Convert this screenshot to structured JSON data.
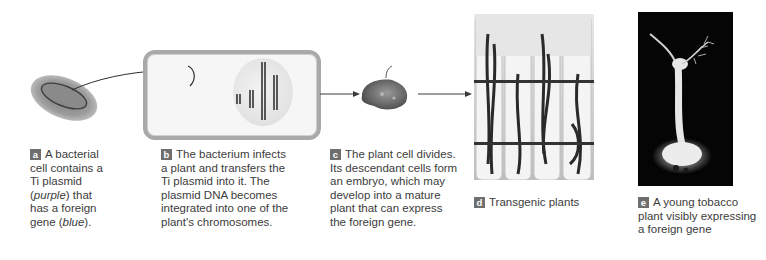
{
  "figure": {
    "steps": [
      {
        "id": "a",
        "badge": "a",
        "text_parts": [
          {
            "text": "A bacterial cell contains a Ti plasmid (",
            "italic": false
          },
          {
            "text": "purple",
            "italic": true
          },
          {
            "text": ") that has a foreign gene (",
            "italic": false
          },
          {
            "text": "blue",
            "italic": true
          },
          {
            "text": ").",
            "italic": false
          }
        ],
        "lines": [
          "A bacterial",
          "cell contains a",
          "Ti plasmid",
          "(purple) that",
          "has a foreign",
          "gene (blue)."
        ]
      },
      {
        "id": "b",
        "badge": "b",
        "lines": [
          "The bacterium infects",
          "a plant and transfers the",
          "Ti plasmid into it. The",
          "plasmid DNA becomes",
          "integrated into one of the",
          "plant's chromosomes."
        ]
      },
      {
        "id": "c",
        "badge": "c",
        "lines": [
          "The plant cell divides.",
          "Its descendant cells form",
          "an embryo, which may",
          "develop into a mature",
          "plant that can express",
          "the foreign gene."
        ]
      },
      {
        "id": "d",
        "badge": "d",
        "lines": [
          "Transgenic plants"
        ]
      },
      {
        "id": "e",
        "badge": "e",
        "lines": [
          "A young tobacco",
          "plant visibly expressing",
          "a foreign gene"
        ]
      }
    ],
    "italic_words": {
      "purple": "purple",
      "blue": "blue"
    },
    "colors": {
      "badge_bg": "#6e6e6e",
      "badge_text": "#ffffff",
      "caption_text": "#3c3c3c",
      "cell_border": "#a9a9a9",
      "photo_e_bg": "#050505"
    },
    "illustrations": [
      {
        "name": "bacterium-with-plasmid"
      },
      {
        "name": "plant-cell-with-nucleus-and-chromosomes"
      },
      {
        "name": "plant-embryo-callus"
      },
      {
        "name": "transgenic-plants-in-test-tubes-photo"
      },
      {
        "name": "glowing-tobacco-plant-photo"
      }
    ]
  }
}
